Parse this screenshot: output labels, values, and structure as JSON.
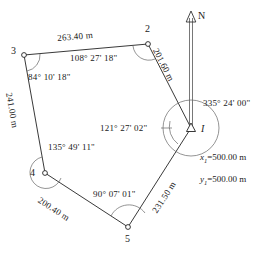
{
  "diagram": {
    "type": "survey-traverse",
    "title": "",
    "north_label": "N",
    "stations": [
      {
        "id": "I",
        "label": "I",
        "x": 191,
        "y": 128,
        "marker": "triangle"
      },
      {
        "id": "2",
        "label": "2",
        "x": 148,
        "y": 44,
        "marker": "circle"
      },
      {
        "id": "3",
        "label": "3",
        "x": 24,
        "y": 55,
        "marker": "circle"
      },
      {
        "id": "4",
        "label": "4",
        "x": 45,
        "y": 173,
        "marker": "circle"
      },
      {
        "id": "5",
        "label": "5",
        "x": 128,
        "y": 227,
        "marker": "circle"
      }
    ],
    "sides": [
      {
        "from": "3",
        "to": "2",
        "length": "263.40 m"
      },
      {
        "from": "2",
        "to": "I",
        "length": "201.60 m"
      },
      {
        "from": "3",
        "to": "4",
        "length": "241.00 m"
      },
      {
        "from": "4",
        "to": "5",
        "length": "200.40 m"
      },
      {
        "from": "5",
        "to": "I",
        "length": "231.50 m"
      }
    ],
    "angles": [
      {
        "at": "I",
        "value": "121° 27' 02\""
      },
      {
        "at": "2",
        "value": "108° 27' 18\""
      },
      {
        "at": "3",
        "value": "84° 10' 18\""
      },
      {
        "at": "4",
        "value": "135° 49' 11\""
      },
      {
        "at": "5",
        "value": "90° 07' 01\""
      }
    ],
    "azimuth": "335° 24' 00\"",
    "coordinates": {
      "x_label": "x",
      "x_sub": "1",
      "x_value": "=500.00 m",
      "y_label": "y",
      "y_sub": "1",
      "y_value": "=500.00 m"
    },
    "colors": {
      "line": "#222222",
      "text": "#1a1a1a",
      "background": "#ffffff"
    }
  }
}
